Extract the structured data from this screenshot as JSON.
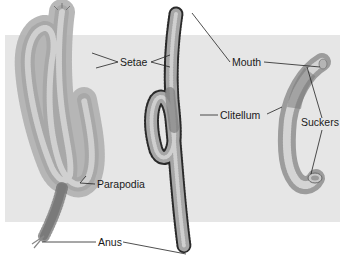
{
  "figure": {
    "colors": {
      "panel_background": "#e6e6e6",
      "page_background": "#ffffff",
      "worm_body": "#b8b8b8",
      "worm_shade": "#8c8c8c",
      "setae_dark": "#333333",
      "leader_line": "#222222"
    }
  },
  "labels": {
    "setae": "Setae",
    "mouth": "Mouth",
    "clitellum": "Clitellum",
    "suckers": "Suckers",
    "parapodia": "Parapodia",
    "anus": "Anus"
  },
  "specimens": [
    {
      "name": "polychaete",
      "features": [
        "Setae",
        "Parapodia",
        "Anus"
      ]
    },
    {
      "name": "oligochaete",
      "features": [
        "Setae",
        "Mouth",
        "Clitellum",
        "Anus"
      ]
    },
    {
      "name": "leech",
      "features": [
        "Mouth",
        "Suckers"
      ]
    }
  ]
}
